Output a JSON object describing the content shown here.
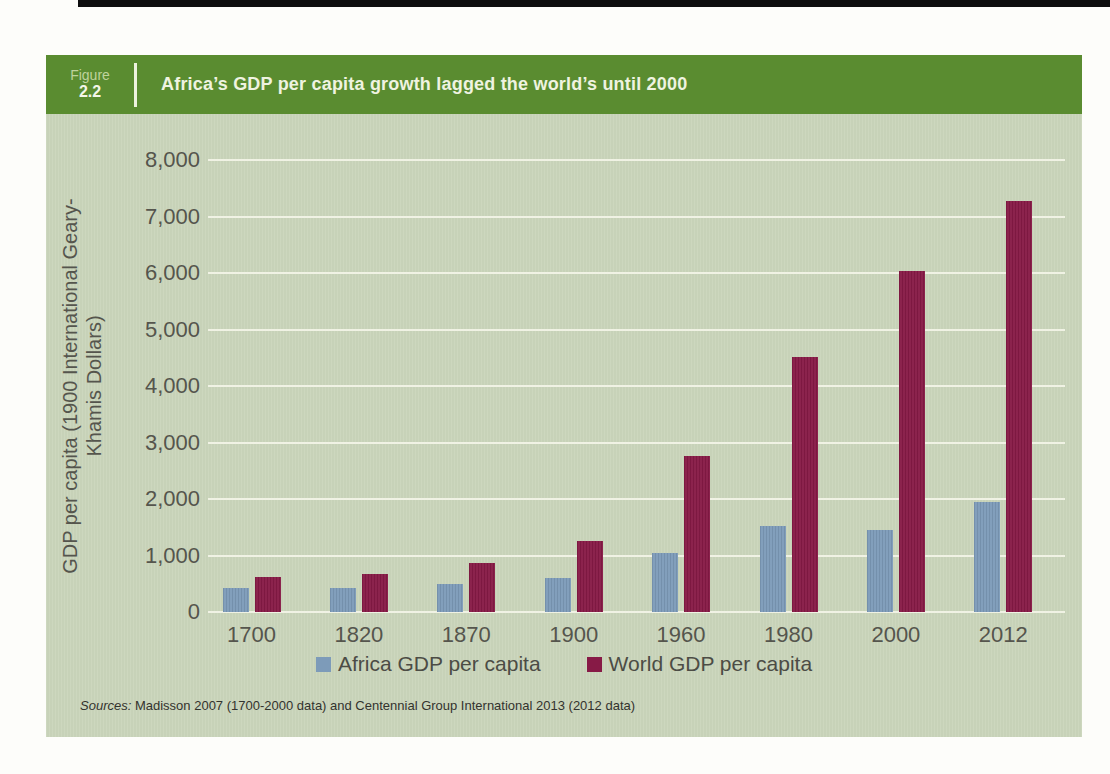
{
  "figure": {
    "label": "Figure",
    "number": "2.2",
    "title": "Africa’s GDP per capita growth lagged the world’s until 2000"
  },
  "colors": {
    "header_green": "#5a8c30",
    "panel_background": "#cad5bb",
    "gridline": "#f0f2e4",
    "africa_bar": "#7d9bb9",
    "world_bar": "#871a46"
  },
  "chart_data": {
    "type": "bar",
    "title": "Africa’s GDP per capita growth lagged the world’s until 2000",
    "categories": [
      "1700",
      "1820",
      "1870",
      "1900",
      "1960",
      "1980",
      "2000",
      "2012"
    ],
    "series": [
      {
        "name": "Africa GDP per capita",
        "color": "#7d9bb9",
        "values": [
          420,
          420,
          500,
          600,
          1050,
          1515,
          1450,
          1950
        ]
      },
      {
        "name": "World GDP per capita",
        "color": "#871a46",
        "values": [
          615,
          665,
          870,
          1260,
          2770,
          4510,
          6040,
          7280
        ]
      }
    ],
    "xlabel": "",
    "ylabel": "GDP per capita (1900 International Geary-Khamis Dollars)",
    "ylabel_line1": "GDP per capita (1900 International Geary-",
    "ylabel_line2": "Khamis Dollars)",
    "ylim": [
      0,
      8000
    ],
    "ytick_step": 1000,
    "yticks": [
      "0",
      "1,000",
      "2,000",
      "3,000",
      "4,000",
      "5,000",
      "6,000",
      "7,000",
      "8,000"
    ],
    "grid": true,
    "legend_position": "bottom"
  },
  "source_note": {
    "prefix": "Sources:",
    "text": " Madisson 2007 (1700-2000 data) and Centennial Group International 2013 (2012 data)"
  }
}
